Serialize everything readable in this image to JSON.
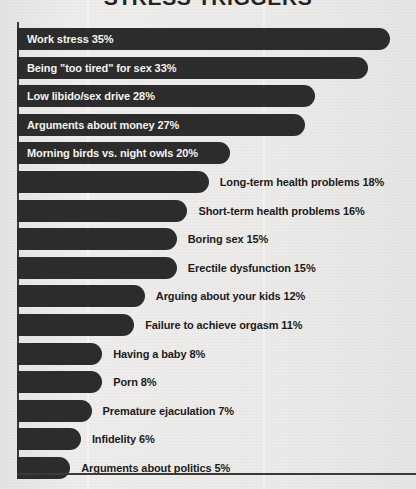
{
  "chart_data": {
    "type": "bar",
    "orientation": "horizontal",
    "title": "STRESS TRIGGERS",
    "xlabel": "",
    "ylabel": "",
    "xlim": [
      0,
      35
    ],
    "grid": false,
    "legend": "none",
    "value_suffix": "%",
    "categories": [
      "Work stress",
      "Being \"too tired\" for sex",
      "Low libido/sex drive",
      "Arguments about money",
      "Morning birds vs. night owls",
      "Long-term health problems",
      "Short-term health problems",
      "Boring sex",
      "Erectile dysfunction",
      "Arguing about your kids",
      "Failure to achieve orgasm",
      "Having a baby",
      "Porn",
      "Premature ejaculation",
      "Infidelity",
      "Arguments about politics"
    ],
    "values": [
      35,
      33,
      28,
      27,
      20,
      18,
      16,
      15,
      15,
      12,
      11,
      8,
      8,
      7,
      6,
      5
    ],
    "bars": [
      {
        "label": "Work stress 35%",
        "category": "Work stress",
        "value": 35,
        "label_position": "inside"
      },
      {
        "label": "Being \"too tired\" for sex 33%",
        "category": "Being \"too tired\" for sex",
        "value": 33,
        "label_position": "inside"
      },
      {
        "label": "Low libido/sex drive 28%",
        "category": "Low libido/sex drive",
        "value": 28,
        "label_position": "inside"
      },
      {
        "label": "Arguments about money 27%",
        "category": "Arguments about money",
        "value": 27,
        "label_position": "inside"
      },
      {
        "label": "Morning birds vs. night owls 20%",
        "category": "Morning birds vs. night owls",
        "value": 20,
        "label_position": "inside"
      },
      {
        "label": "Long-term health problems 18%",
        "category": "Long-term health problems",
        "value": 18,
        "label_position": "outside"
      },
      {
        "label": "Short-term health problems 16%",
        "category": "Short-term health problems",
        "value": 16,
        "label_position": "outside"
      },
      {
        "label": "Boring sex 15%",
        "category": "Boring sex",
        "value": 15,
        "label_position": "outside"
      },
      {
        "label": "Erectile dysfunction 15%",
        "category": "Erectile dysfunction",
        "value": 15,
        "label_position": "outside"
      },
      {
        "label": "Arguing about your kids 12%",
        "category": "Arguing about your kids",
        "value": 12,
        "label_position": "outside"
      },
      {
        "label": "Failure to achieve orgasm 11%",
        "category": "Failure to achieve orgasm",
        "value": 11,
        "label_position": "outside"
      },
      {
        "label": "Having a baby 8%",
        "category": "Having a baby",
        "value": 8,
        "label_position": "outside"
      },
      {
        "label": "Porn 8%",
        "category": "Porn",
        "value": 8,
        "label_position": "outside"
      },
      {
        "label": "Premature ejaculation 7%",
        "category": "Premature ejaculation",
        "value": 7,
        "label_position": "outside"
      },
      {
        "label": "Infidelity 6%",
        "category": "Infidelity",
        "value": 6,
        "label_position": "outside"
      },
      {
        "label": "Arguments about politics 5%",
        "category": "Arguments about politics",
        "value": 5,
        "label_position": "outside"
      }
    ],
    "colors": {
      "bar": "#2c2c2c",
      "background": "#ebeae8",
      "axis": "#3a3a3a",
      "label_inside": "#f4f3f1",
      "label_outside": "#1c1c1c",
      "title": "#242424"
    }
  }
}
